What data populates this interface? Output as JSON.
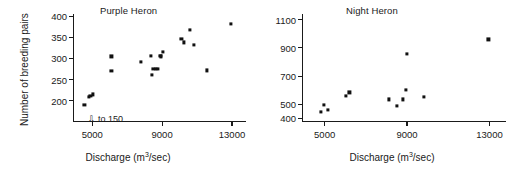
{
  "figure": {
    "background": "#ffffff",
    "marker_color": "#111111",
    "axis_color": "#1a1a1a"
  },
  "chart_data": [
    {
      "type": "scatter",
      "title": "Purple Heron",
      "xlabel_text": "Discharge (m",
      "xlabel_sup": "3",
      "xlabel_tail": "/sec)",
      "ylabel": "Number of breeding pairs",
      "xlim": [
        3900,
        13800
      ],
      "ylim": [
        150,
        405
      ],
      "grid": false,
      "legend": "none",
      "xticks": [
        5000,
        9000,
        13000
      ],
      "xticklabels": [
        "5000",
        "9000",
        "13000"
      ],
      "yticks": [
        200,
        250,
        300,
        350,
        400
      ],
      "yticklabels": [
        "200",
        "250",
        "300",
        "350",
        "400"
      ],
      "annotations": [
        {
          "text": "to 150",
          "glyph": "⇩",
          "x": 4750,
          "y": 168
        }
      ],
      "x": [
        4550,
        4800,
        4900,
        5050,
        6100,
        6100,
        7800,
        8350,
        8400,
        8500,
        8650,
        8750,
        8900,
        8950,
        9050,
        10100,
        10250,
        10600,
        10800,
        11550,
        12950
      ],
      "y": [
        191,
        209,
        211,
        215,
        305,
        271,
        291,
        306,
        262,
        276,
        276,
        276,
        306,
        305,
        316,
        347,
        338,
        367,
        332,
        272,
        382
      ]
    },
    {
      "type": "scatter",
      "title": "Night Heron",
      "xlabel_text": "Discharge (m",
      "xlabel_sup": "3",
      "xlabel_tail": "/sec)",
      "ylabel": "",
      "xlim": [
        3900,
        13800
      ],
      "ylim": [
        350,
        1140
      ],
      "grid": false,
      "legend": "none",
      "xticks": [
        5000,
        9000,
        13000
      ],
      "xticklabels": [
        "5000",
        "9000",
        "13000"
      ],
      "yticks": [
        400,
        500,
        700,
        900,
        1100
      ],
      "yticklabels": [
        "400",
        "500",
        "700",
        "900",
        "1100"
      ],
      "annotations": [],
      "x": [
        4800,
        4950,
        5150,
        6050,
        6200,
        8100,
        8500,
        8800,
        8950,
        9000,
        9800,
        12950
      ],
      "y": [
        445,
        498,
        463,
        560,
        585,
        535,
        487,
        535,
        600,
        855,
        552,
        960
      ]
    }
  ],
  "panel_left": {
    "title": "Purple Heron"
  },
  "panel_right": {
    "title": "Night Heron"
  }
}
